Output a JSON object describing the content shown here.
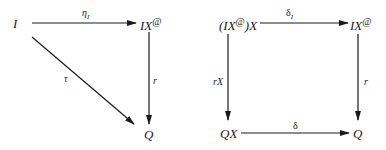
{
  "diagrams": [
    {
      "name": "triangle",
      "nodes": {
        "I": "I",
        "IX_at": {
          "base": "IX",
          "sup": "@"
        },
        "Q": "Q"
      },
      "edges": {
        "eta": "η",
        "eta_sub": "I",
        "tau": "τ",
        "r": "r"
      }
    },
    {
      "name": "square",
      "nodes": {
        "top_left": {
          "prefix": "(IX",
          "sup": "@",
          "suffix": ")X"
        },
        "top_right": {
          "base": "IX",
          "sup": "@"
        },
        "bottom_left": "QX",
        "bottom_right": "Q"
      },
      "edges": {
        "delta_I": "δ",
        "delta_I_sub": "I",
        "rX": "rX",
        "r": "r",
        "delta": "δ"
      }
    }
  ],
  "colors": {
    "stroke": "#1a1a1a",
    "background": "#ffffff"
  }
}
